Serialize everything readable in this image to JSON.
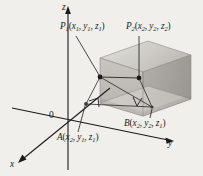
{
  "figure": {
    "background_color": "#f0efec",
    "ink_color": "#1d1b1a",
    "box_fill_light": "#d8d6d2",
    "box_fill_mid": "#bfbcb7",
    "box_fill_dark": "#a3a09b"
  },
  "axes": {
    "z_label": "z",
    "y_label": "y",
    "x_label": "x",
    "origin_label": "0"
  },
  "points": {
    "p1": {
      "name": "P",
      "sub": "1",
      "coords": [
        "x",
        "1",
        "y",
        "1",
        "z",
        "1"
      ],
      "text": "P1(x1, y1, z1)"
    },
    "p2": {
      "name": "P",
      "sub": "2",
      "coords": [
        "x",
        "2",
        "y",
        "2",
        "z",
        "2"
      ],
      "text": "P2(x2, y2, z2)"
    },
    "a": {
      "name": "A",
      "sub": "",
      "coords": [
        "x",
        "2",
        "y",
        "1",
        "z",
        "1"
      ],
      "text": "A(x2, y1, z1)"
    },
    "b": {
      "name": "B",
      "sub": "",
      "coords": [
        "x",
        "2",
        "y",
        "2",
        "z",
        "1"
      ],
      "text": "B(x2, y2, z1)"
    }
  },
  "markers": {
    "right_angle_a": "right-angle-mark",
    "right_angle_b": "right-angle-mark"
  }
}
